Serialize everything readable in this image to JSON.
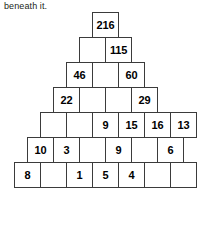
{
  "instruction": {
    "text": "beneath it."
  },
  "puzzle": {
    "type": "number-pyramid",
    "rows": 7,
    "cell_width_px": 27,
    "cell_height_px": 26,
    "border_color": "#3b3b3b",
    "background_color": "#ffffff",
    "text_color": "#000000",
    "grid": [
      [
        "216"
      ],
      [
        "",
        "115"
      ],
      [
        "46",
        "",
        "60"
      ],
      [
        "22",
        "",
        "",
        "29"
      ],
      [
        "",
        "",
        "9",
        "15",
        "16",
        "13"
      ],
      [
        "10",
        "3",
        "",
        "9",
        "",
        "6"
      ],
      [
        "8",
        "",
        "1",
        "5",
        "4",
        "",
        ""
      ]
    ]
  },
  "chart_data": {
    "type": "table",
    "rows": [
      {
        "index": 1,
        "cells": [
          "216"
        ]
      },
      {
        "index": 2,
        "cells": [
          "",
          "115"
        ]
      },
      {
        "index": 3,
        "cells": [
          "46",
          "",
          "60"
        ]
      },
      {
        "index": 4,
        "cells": [
          "22",
          "",
          "",
          "29"
        ]
      },
      {
        "index": 5,
        "cells": [
          "",
          "",
          "9",
          "15",
          "16",
          "13"
        ]
      },
      {
        "index": 6,
        "cells": [
          "10",
          "3",
          "",
          "9",
          "",
          "6"
        ]
      },
      {
        "index": 7,
        "cells": [
          "8",
          "",
          "1",
          "5",
          "4",
          "",
          ""
        ]
      }
    ]
  }
}
